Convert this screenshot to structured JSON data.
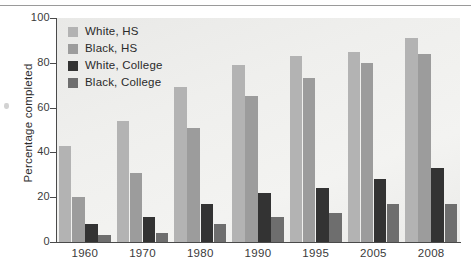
{
  "chart_data": {
    "type": "bar",
    "title": "",
    "subtitle": "",
    "xlabel": "",
    "ylabel": "Percentage completed",
    "categories": [
      "1960",
      "1970",
      "1980",
      "1990",
      "1995",
      "2005",
      "2008"
    ],
    "series": [
      {
        "name": "White, HS",
        "color": "#b3b3b3",
        "values": [
          43,
          54,
          69,
          79,
          83,
          85,
          91
        ]
      },
      {
        "name": "Black, HS",
        "color": "#9c9c9c",
        "values": [
          20,
          31,
          51,
          65,
          73,
          80,
          84
        ]
      },
      {
        "name": "White, College",
        "color": "#333333",
        "values": [
          8,
          11,
          17,
          22,
          24,
          28,
          33
        ]
      },
      {
        "name": "Black, College",
        "color": "#6e6e6e",
        "values": [
          3,
          4,
          8,
          11,
          13,
          17,
          17
        ]
      }
    ],
    "ylim": [
      0,
      100
    ],
    "yticks": [
      0,
      20,
      40,
      60,
      80,
      100
    ],
    "ytick_labels": [
      "0",
      "20",
      "40",
      "60",
      "80",
      "100"
    ],
    "grid": false,
    "legend_position": "top-left-inside",
    "plot_background": "#efefed",
    "axis_color": "#4a4a4a"
  }
}
